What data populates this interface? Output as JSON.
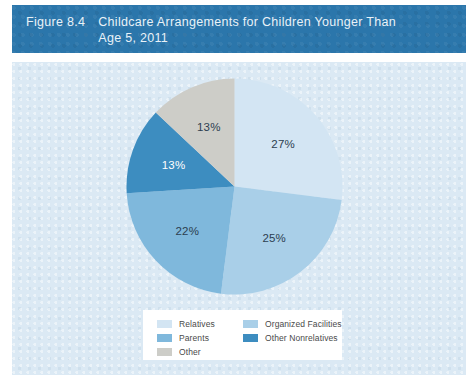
{
  "figure": {
    "number": "Figure 8.4",
    "title": "Childcare Arrangements for Children Younger Than Age 5, 2011"
  },
  "colors": {
    "title_bar": "#2b76ab",
    "panel_background": "#dbe9f4",
    "page_background": "#ffffff",
    "legend_background": "#ffffff",
    "relatives": "#d3e5f3",
    "organized_facilities": "#a9cfe8",
    "parents": "#7fb8dc",
    "other_nonrelatives": "#3d8dc0",
    "other": "#cdcdc8",
    "label_dark": "#2c3e50",
    "label_light": "#ffffff"
  },
  "chart_data": {
    "type": "pie",
    "title": "Childcare Arrangements for Children Younger Than Age 5, 2011",
    "xlabel": "",
    "ylabel": "",
    "legend_position": "bottom",
    "start_angle_deg": 0,
    "direction": "clockwise",
    "categories": [
      "Relatives",
      "Organized Facilities",
      "Parents",
      "Other Nonrelatives",
      "Other"
    ],
    "values": [
      27,
      25,
      22,
      13,
      13
    ],
    "value_labels": [
      "27%",
      "25%",
      "22%",
      "13%",
      "13%"
    ],
    "colors": [
      "#d3e5f3",
      "#a9cfe8",
      "#7fb8dc",
      "#3d8dc0",
      "#cdcdc8"
    ],
    "label_colors": [
      "#2c3e50",
      "#2c3e50",
      "#2c3e50",
      "#ffffff",
      "#2c3e50"
    ],
    "slices": [
      {
        "name": "Relatives",
        "value": 27,
        "label": "27%",
        "color": "#d3e5f3",
        "label_color": "#2c3e50"
      },
      {
        "name": "Organized Facilities",
        "value": 25,
        "label": "25%",
        "color": "#a9cfe8",
        "label_color": "#2c3e50"
      },
      {
        "name": "Parents",
        "value": 22,
        "label": "22%",
        "color": "#7fb8dc",
        "label_color": "#2c3e50"
      },
      {
        "name": "Other Nonrelatives",
        "value": 13,
        "label": "13%",
        "color": "#3d8dc0",
        "label_color": "#ffffff"
      },
      {
        "name": "Other",
        "value": 13,
        "label": "13%",
        "color": "#cdcdc8",
        "label_color": "#2c3e50"
      }
    ]
  },
  "legend": {
    "items": [
      {
        "label": "Relatives",
        "color": "#d3e5f3"
      },
      {
        "label": "Organized Facilities",
        "color": "#a9cfe8"
      },
      {
        "label": "Parents",
        "color": "#7fb8dc"
      },
      {
        "label": "Other Nonrelatives",
        "color": "#3d8dc0"
      },
      {
        "label": "Other",
        "color": "#cdcdc8"
      }
    ]
  }
}
